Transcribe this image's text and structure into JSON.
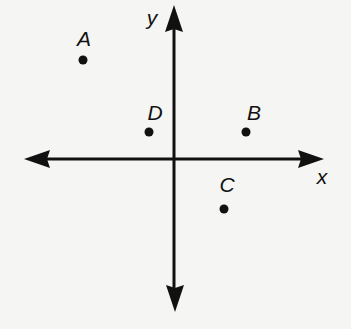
{
  "diagram": {
    "type": "coordinate-plane",
    "axes": {
      "x_label": "x",
      "y_label": "y",
      "origin_px": [
        174,
        159
      ]
    },
    "points": [
      {
        "label": "A",
        "px": [
          83,
          60
        ],
        "label_px": [
          84,
          38
        ],
        "quadrant": "II"
      },
      {
        "label": "D",
        "px": [
          149,
          132
        ],
        "label_px": [
          155,
          112
        ],
        "quadrant": "II"
      },
      {
        "label": "B",
        "px": [
          246,
          132
        ],
        "label_px": [
          254,
          112
        ],
        "quadrant": "I"
      },
      {
        "label": "C",
        "px": [
          224,
          209
        ],
        "label_px": [
          227,
          184
        ],
        "quadrant": "IV"
      }
    ],
    "colors": {
      "ink": "#111111",
      "background": "#f5f5f3"
    }
  }
}
